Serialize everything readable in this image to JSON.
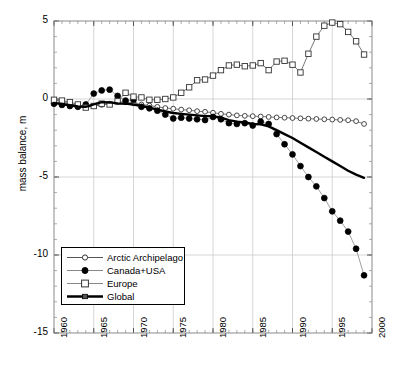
{
  "chart_data": {
    "type": "line",
    "title": "",
    "xlabel": "",
    "ylabel": "mass balance, m",
    "xlim": [
      1960,
      2000
    ],
    "ylim": [
      -15,
      5
    ],
    "xticks": [
      1960,
      1965,
      1970,
      1975,
      1980,
      1985,
      1990,
      1995,
      2000
    ],
    "yticks": [
      5,
      0,
      -5,
      -10,
      -15
    ],
    "xtick_labels": [
      "1960",
      "1965",
      "1970",
      "1975",
      "1980",
      "1985",
      "1990",
      "1995",
      "2000"
    ],
    "ytick_labels": [
      "5",
      "0",
      "-5",
      "-10",
      "-15"
    ],
    "xminor_interval": 1,
    "yminor_interval": 1,
    "grid": true,
    "grid_color": "#cccccc",
    "legend_position": "lower-left",
    "series": [
      {
        "name": "Arctic Archipelago",
        "marker": "open-circle",
        "color": "#555555",
        "line_width": 0.8,
        "x": [
          1960,
          1961,
          1962,
          1963,
          1964,
          1965,
          1966,
          1967,
          1968,
          1969,
          1970,
          1971,
          1972,
          1973,
          1974,
          1975,
          1976,
          1977,
          1978,
          1979,
          1980,
          1981,
          1982,
          1983,
          1984,
          1985,
          1986,
          1987,
          1988,
          1989,
          1990,
          1991,
          1992,
          1993,
          1994,
          1995,
          1996,
          1997,
          1998,
          1999
        ],
        "y": [
          -0.05,
          -0.18,
          -0.3,
          -0.42,
          -0.5,
          -0.45,
          -0.38,
          -0.3,
          -0.2,
          -0.18,
          -0.28,
          -0.35,
          -0.42,
          -0.5,
          -0.58,
          -0.62,
          -0.68,
          -0.72,
          -0.78,
          -0.82,
          -0.88,
          -0.95,
          -1.0,
          -1.05,
          -1.08,
          -1.1,
          -1.12,
          -1.15,
          -1.18,
          -1.2,
          -1.22,
          -1.24,
          -1.26,
          -1.28,
          -1.3,
          -1.32,
          -1.34,
          -1.36,
          -1.42,
          -1.6
        ]
      },
      {
        "name": "Canada+USA",
        "marker": "filled-circle",
        "color": "#888888",
        "line_width": 0.8,
        "x": [
          1960,
          1961,
          1962,
          1963,
          1964,
          1965,
          1966,
          1967,
          1968,
          1969,
          1970,
          1971,
          1972,
          1973,
          1974,
          1975,
          1976,
          1977,
          1978,
          1979,
          1980,
          1981,
          1982,
          1983,
          1984,
          1985,
          1986,
          1987,
          1988,
          1989,
          1990,
          1991,
          1992,
          1993,
          1994,
          1995,
          1996,
          1997,
          1998,
          1999
        ],
        "y": [
          -0.3,
          -0.38,
          -0.45,
          -0.5,
          -0.35,
          0.35,
          0.55,
          0.6,
          0.2,
          -0.1,
          -0.05,
          -0.5,
          -0.6,
          -0.75,
          -1.0,
          -1.25,
          -1.2,
          -1.25,
          -1.3,
          -1.35,
          -1.15,
          -1.3,
          -1.55,
          -1.6,
          -1.55,
          -1.7,
          -1.45,
          -1.6,
          -2.25,
          -2.9,
          -3.55,
          -4.3,
          -5.0,
          -5.6,
          -6.35,
          -7.2,
          -7.8,
          -8.5,
          -9.6,
          -11.3
        ]
      },
      {
        "name": "Europe",
        "marker": "open-square",
        "color": "#555555",
        "line_width": 0.8,
        "x": [
          1960,
          1961,
          1962,
          1963,
          1964,
          1965,
          1966,
          1967,
          1968,
          1969,
          1970,
          1971,
          1972,
          1973,
          1974,
          1975,
          1976,
          1977,
          1978,
          1979,
          1980,
          1981,
          1982,
          1983,
          1984,
          1985,
          1986,
          1987,
          1988,
          1989,
          1990,
          1991,
          1992,
          1993,
          1994,
          1995,
          1996,
          1997,
          1998,
          1999
        ],
        "y": [
          -0.05,
          -0.1,
          -0.2,
          -0.35,
          -0.55,
          -0.45,
          -0.3,
          -0.35,
          -0.15,
          0.4,
          0.15,
          0.1,
          -0.05,
          -0.05,
          0.0,
          0.1,
          0.4,
          0.75,
          1.2,
          1.25,
          1.5,
          1.85,
          2.15,
          2.2,
          2.1,
          2.15,
          2.3,
          1.85,
          2.4,
          2.45,
          2.2,
          1.7,
          2.9,
          4.0,
          4.7,
          4.9,
          4.8,
          4.3,
          3.7,
          2.85
        ]
      },
      {
        "name": "Global",
        "marker": "none",
        "color": "#000000",
        "line_width": 2.4,
        "x": [
          1960,
          1961,
          1962,
          1963,
          1964,
          1965,
          1966,
          1967,
          1968,
          1969,
          1970,
          1971,
          1972,
          1973,
          1974,
          1975,
          1976,
          1977,
          1978,
          1979,
          1980,
          1981,
          1982,
          1983,
          1984,
          1985,
          1986,
          1987,
          1988,
          1989,
          1990,
          1991,
          1992,
          1993,
          1994,
          1995,
          1996,
          1997,
          1998,
          1999
        ],
        "y": [
          -0.25,
          -0.32,
          -0.4,
          -0.48,
          -0.5,
          -0.35,
          -0.2,
          -0.22,
          -0.28,
          -0.3,
          -0.35,
          -0.45,
          -0.55,
          -0.68,
          -0.8,
          -0.9,
          -0.95,
          -1.0,
          -1.05,
          -1.1,
          -1.1,
          -1.2,
          -1.35,
          -1.45,
          -1.5,
          -1.6,
          -1.62,
          -1.75,
          -2.0,
          -2.25,
          -2.5,
          -2.8,
          -3.1,
          -3.4,
          -3.7,
          -4.0,
          -4.3,
          -4.6,
          -4.85,
          -5.05
        ]
      }
    ]
  },
  "legend": {
    "items": [
      {
        "label": "Arctic Archipelago",
        "marker": "open-circle"
      },
      {
        "label": "Canada+USA",
        "marker": "filled-circle"
      },
      {
        "label": "Europe",
        "marker": "open-square"
      },
      {
        "label": "Global",
        "marker": "thick-line"
      }
    ]
  },
  "axes": {
    "y_axis_title": "mass balance, m"
  }
}
